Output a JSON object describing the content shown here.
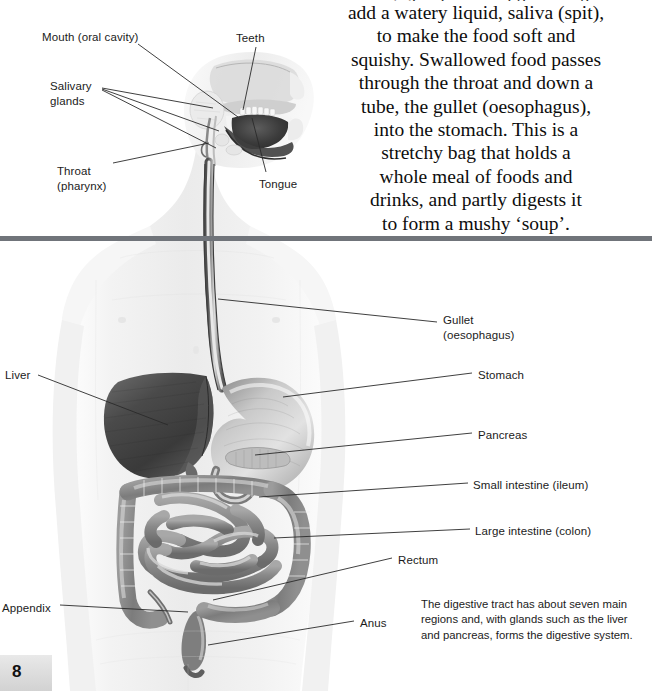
{
  "page": {
    "folio": "8",
    "width": 652,
    "height": 691,
    "rule_color": "#70747a",
    "background": "#ffffff",
    "ink_color": "#1b1b1b"
  },
  "body_text": {
    "clipped_top_line": "...ing glands around the mouth",
    "lines": [
      "add a watery liquid, saliva (spit),",
      "to make the food soft and",
      "squishy. Swallowed food passes",
      "through the throat and down a",
      "tube, the gullet (oesophagus),",
      "into the stomach. This is a",
      "stretchy bag that holds a",
      "whole meal of foods and",
      "drinks, and partly digests it",
      "to form a mushy ‘soup’."
    ]
  },
  "caption": {
    "text": "The digestive tract has about seven main regions and, with glands such as the liver and pancreas, forms the digestive system."
  },
  "illustration": {
    "name": "human-digestive-system",
    "style": "greyscale-airbrush-anatomical",
    "organs": [
      "mouth",
      "teeth",
      "tongue",
      "salivary glands",
      "pharynx",
      "oesophagus",
      "stomach",
      "liver",
      "pancreas",
      "small intestine",
      "large intestine",
      "appendix",
      "rectum",
      "anus"
    ]
  },
  "labels": {
    "left": [
      {
        "id": "mouth",
        "text": "Mouth (oral cavity)",
        "x": 42,
        "y": 30
      },
      {
        "id": "salivary",
        "text": "Salivary\nglands",
        "x": 50,
        "y": 79
      },
      {
        "id": "throat",
        "text": "Throat\n(pharynx)",
        "x": 57,
        "y": 164
      },
      {
        "id": "liver",
        "text": "Liver",
        "x": 5,
        "y": 368
      },
      {
        "id": "appendix",
        "text": "Appendix",
        "x": 2,
        "y": 601
      }
    ],
    "top": [
      {
        "id": "teeth",
        "text": "Teeth",
        "x": 236,
        "y": 31
      },
      {
        "id": "tongue",
        "text": "Tongue",
        "x": 259,
        "y": 177
      }
    ],
    "right": [
      {
        "id": "gullet",
        "text": "Gullet\n(oesophagus)",
        "x": 443,
        "y": 313
      },
      {
        "id": "stomach",
        "text": "Stomach",
        "x": 478,
        "y": 368
      },
      {
        "id": "pancreas",
        "text": "Pancreas",
        "x": 478,
        "y": 428
      },
      {
        "id": "small-intestine",
        "text": "Small intestine (ileum)",
        "x": 473,
        "y": 478
      },
      {
        "id": "large-intestine",
        "text": "Large intestine (colon)",
        "x": 475,
        "y": 524
      },
      {
        "id": "rectum",
        "text": "Rectum",
        "x": 398,
        "y": 553
      },
      {
        "id": "anus",
        "text": "Anus",
        "x": 360,
        "y": 616
      }
    ]
  },
  "leader_lines": [
    {
      "id": "mouth-leader",
      "x1": 138,
      "y1": 44,
      "x2": 238,
      "y2": 117
    },
    {
      "id": "salivary-leader-1",
      "x1": 102,
      "y1": 88,
      "x2": 213,
      "y2": 108
    },
    {
      "id": "salivary-leader-2",
      "x1": 102,
      "y1": 89,
      "x2": 219,
      "y2": 131
    },
    {
      "id": "salivary-leader-3",
      "x1": 102,
      "y1": 90,
      "x2": 216,
      "y2": 148
    },
    {
      "id": "throat-leader",
      "x1": 113,
      "y1": 163,
      "x2": 209,
      "y2": 143
    },
    {
      "id": "teeth-leader",
      "x1": 256,
      "y1": 47,
      "x2": 243,
      "y2": 110
    },
    {
      "id": "tongue-leader",
      "x1": 266,
      "y1": 172,
      "x2": 252,
      "y2": 118
    },
    {
      "id": "gullet-leader",
      "x1": 218,
      "y1": 299,
      "x2": 437,
      "y2": 322
    },
    {
      "id": "stomach-leader",
      "x1": 283,
      "y1": 397,
      "x2": 472,
      "y2": 373
    },
    {
      "id": "pancreas-leader",
      "x1": 255,
      "y1": 455,
      "x2": 472,
      "y2": 433
    },
    {
      "id": "small-intestine-leader",
      "x1": 259,
      "y1": 497,
      "x2": 468,
      "y2": 483
    },
    {
      "id": "large-intestine-leader",
      "x1": 274,
      "y1": 538,
      "x2": 470,
      "y2": 529
    },
    {
      "id": "rectum-leader",
      "x1": 213,
      "y1": 600,
      "x2": 392,
      "y2": 558
    },
    {
      "id": "anus-leader",
      "x1": 208,
      "y1": 645,
      "x2": 354,
      "y2": 621
    },
    {
      "id": "liver-leader",
      "x1": 38,
      "y1": 375,
      "x2": 168,
      "y2": 425
    },
    {
      "id": "appendix-leader",
      "x1": 60,
      "y1": 605,
      "x2": 188,
      "y2": 612
    }
  ],
  "rules": [
    {
      "id": "mid-rule",
      "y": 236
    }
  ]
}
